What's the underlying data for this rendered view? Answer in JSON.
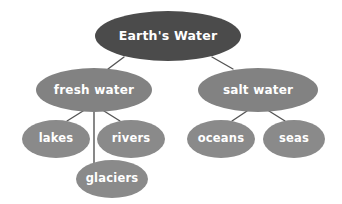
{
  "diagram": {
    "type": "hierarchy-tree",
    "title": "Earth's Water",
    "background_color": "#ffffff",
    "edge_color": "#555555",
    "nodes": [
      {
        "id": "earths-water",
        "label": "Earth's Water",
        "level": 0,
        "fill": "#4b4b4b",
        "text_color": "#ffffff",
        "cx": 168,
        "cy": 36,
        "rx": 73,
        "ry": 25
      },
      {
        "id": "fresh-water",
        "label": "fresh water",
        "level": 1,
        "fill": "#828282",
        "text_color": "#ffffff",
        "cx": 94,
        "cy": 90,
        "rx": 58,
        "ry": 22
      },
      {
        "id": "salt-water",
        "label": "salt water",
        "level": 1,
        "fill": "#828282",
        "text_color": "#ffffff",
        "cx": 258,
        "cy": 90,
        "rx": 60,
        "ry": 22
      },
      {
        "id": "lakes",
        "label": "lakes",
        "level": 2,
        "fill": "#8a8a8a",
        "text_color": "#ffffff",
        "cx": 56,
        "cy": 139,
        "rx": 34,
        "ry": 19
      },
      {
        "id": "rivers",
        "label": "rivers",
        "level": 2,
        "fill": "#8a8a8a",
        "text_color": "#ffffff",
        "cx": 131,
        "cy": 139,
        "rx": 34,
        "ry": 19
      },
      {
        "id": "glaciers",
        "label": "glaciers",
        "level": 2,
        "fill": "#8a8a8a",
        "text_color": "#ffffff",
        "cx": 112,
        "cy": 179,
        "rx": 36,
        "ry": 19
      },
      {
        "id": "oceans",
        "label": "oceans",
        "level": 2,
        "fill": "#8a8a8a",
        "text_color": "#ffffff",
        "cx": 221,
        "cy": 139,
        "rx": 34,
        "ry": 19
      },
      {
        "id": "seas",
        "label": "seas",
        "level": 2,
        "fill": "#8a8a8a",
        "text_color": "#ffffff",
        "cx": 294,
        "cy": 139,
        "rx": 31,
        "ry": 19
      }
    ],
    "edges": [
      {
        "from": "earths-water",
        "to": "fresh-water",
        "x1": 124,
        "y1": 57,
        "x2": 108,
        "y2": 69
      },
      {
        "from": "earths-water",
        "to": "salt-water",
        "x1": 212,
        "y1": 57,
        "x2": 233,
        "y2": 69
      },
      {
        "from": "fresh-water",
        "to": "lakes",
        "x1": 83,
        "y1": 111,
        "x2": 67,
        "y2": 121
      },
      {
        "from": "fresh-water",
        "to": "rivers",
        "x1": 104,
        "y1": 111,
        "x2": 120,
        "y2": 121
      },
      {
        "from": "fresh-water",
        "to": "glaciers",
        "x1": 94,
        "y1": 110,
        "x2": 94,
        "y2": 172
      },
      {
        "from": "salt-water",
        "to": "oceans",
        "x1": 247,
        "y1": 111,
        "x2": 232,
        "y2": 121
      },
      {
        "from": "salt-water",
        "to": "seas",
        "x1": 269,
        "y1": 111,
        "x2": 285,
        "y2": 121
      }
    ]
  }
}
